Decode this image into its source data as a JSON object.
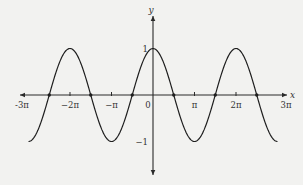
{
  "chart_data": {
    "type": "line",
    "title": "",
    "function": "y = cos x",
    "xlabel": "x",
    "ylabel": "y",
    "xlim": [
      -9.42478,
      9.42478
    ],
    "ylim": [
      -1,
      1
    ],
    "grid": false,
    "legend": null,
    "x_ticks": [
      {
        "value": -9.42478,
        "label": "-3π"
      },
      {
        "value": -6.28319,
        "label": "−2π"
      },
      {
        "value": -3.14159,
        "label": "−π"
      },
      {
        "value": 0,
        "label": "0"
      },
      {
        "value": 3.14159,
        "label": "π"
      },
      {
        "value": 6.28319,
        "label": "2π"
      },
      {
        "value": 9.42478,
        "label": "3π"
      }
    ],
    "y_ticks": [
      {
        "value": 1,
        "label": "1"
      },
      {
        "value": -1,
        "label": "−1"
      }
    ],
    "marked_points": [
      {
        "x": -7.85398,
        "y": 0,
        "label": "-5π/2"
      },
      {
        "x": -4.71239,
        "y": 0,
        "label": "-3π/2"
      },
      {
        "x": -1.5708,
        "y": 0,
        "label": "-π/2"
      },
      {
        "x": 1.5708,
        "y": 0,
        "label": "π/2"
      },
      {
        "x": 4.71239,
        "y": 0,
        "label": "3π/2"
      },
      {
        "x": 7.85398,
        "y": 0,
        "label": "5π/2"
      }
    ],
    "series": [
      {
        "name": "cos x",
        "x": [
          -9.42478,
          -7.85398,
          -6.28319,
          -4.71239,
          -3.14159,
          -1.5708,
          0,
          1.5708,
          3.14159,
          4.71239,
          6.28319,
          7.85398,
          9.42478
        ],
        "values": [
          -1,
          0,
          1,
          0,
          -1,
          0,
          1,
          0,
          -1,
          0,
          1,
          0,
          -1
        ]
      }
    ]
  },
  "layout": {
    "origin_px": [
      153,
      95
    ],
    "px_per_pi": 41.5,
    "px_per_unit_y": 46.5,
    "axis_x_px": [
      20,
      287
    ],
    "axis_y_px": [
      16,
      175
    ],
    "colors": {
      "background": "#f2f2f0",
      "axis": "#2a2a2a",
      "curve": "#1e1e1e",
      "text": "#333333"
    }
  }
}
